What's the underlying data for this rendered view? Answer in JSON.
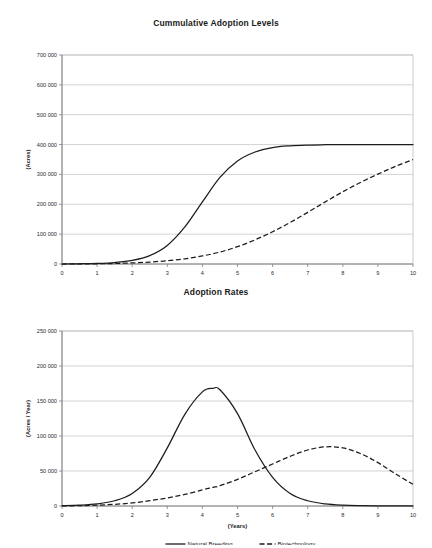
{
  "chart_data": [
    {
      "type": "line",
      "title": "Cummulative Adoption Levels",
      "xlabel": "(Years)",
      "ylabel": "(Acres)",
      "xlim": [
        0,
        10
      ],
      "ylim": [
        0,
        700000
      ],
      "xticks": [
        "0",
        "1",
        "2",
        "3",
        "4",
        "5",
        "6",
        "7",
        "8",
        "9",
        "10"
      ],
      "yticks": [
        "0",
        "100 000",
        "200 000",
        "300 000",
        "400 000",
        "500 000",
        "600 000",
        "700 000"
      ],
      "ytick_values": [
        0,
        100000,
        200000,
        300000,
        400000,
        500000,
        600000,
        700000
      ],
      "grid": true,
      "legend_position": "none",
      "x": [
        0,
        0.5,
        1,
        1.5,
        2,
        2.5,
        3,
        3.5,
        4,
        4.5,
        5,
        5.5,
        6,
        6.5,
        7,
        7.5,
        8,
        8.5,
        9,
        9.5,
        10
      ],
      "series": [
        {
          "name": "Natural Breeding",
          "style": "solid",
          "values": [
            0,
            800,
            2000,
            5000,
            12000,
            28000,
            62000,
            124000,
            208000,
            290000,
            345000,
            375000,
            390000,
            396000,
            398500,
            399500,
            400000,
            400000,
            400000,
            400000,
            400000
          ]
        },
        {
          "name": "Biotechnology",
          "style": "dashed",
          "values": [
            0,
            300,
            800,
            1800,
            3600,
            6500,
            11000,
            17500,
            27000,
            40000,
            58000,
            81000,
            108000,
            139000,
            173000,
            208000,
            242000,
            273000,
            301000,
            327000,
            350000
          ]
        }
      ]
    },
    {
      "type": "line",
      "title": "Adoption Rates",
      "xlabel": "(Years)",
      "ylabel": "(Acres / Year)",
      "xlim": [
        0,
        10
      ],
      "ylim": [
        0,
        250000
      ],
      "xticks": [
        "0",
        "1",
        "2",
        "3",
        "4",
        "5",
        "6",
        "7",
        "8",
        "9",
        "10"
      ],
      "yticks": [
        "0",
        "50 000",
        "100 000",
        "150 000",
        "200 000",
        "250 000"
      ],
      "ytick_values": [
        0,
        50000,
        100000,
        150000,
        200000,
        250000
      ],
      "grid": true,
      "legend_position": "bottom",
      "x": [
        0,
        0.5,
        1,
        1.5,
        2,
        2.5,
        3,
        3.5,
        4,
        4.3,
        4.5,
        5,
        5.5,
        6,
        6.5,
        7,
        7.5,
        8,
        8.5,
        9,
        9.5,
        10
      ],
      "series": [
        {
          "name": "Natural Breeding",
          "style": "solid",
          "values": [
            400,
            1200,
            3000,
            7500,
            18000,
            41000,
            83000,
            131000,
            163000,
            168000,
            166000,
            132000,
            80000,
            41000,
            18000,
            7500,
            3000,
            1200,
            500,
            200,
            100,
            50
          ]
        },
        {
          "name": "Biotechnology",
          "style": "dashed",
          "values": [
            200,
            500,
            1200,
            2400,
            4400,
            7600,
            11500,
            16500,
            23000,
            26500,
            29000,
            38000,
            49000,
            60000,
            71000,
            80000,
            84500,
            83000,
            75000,
            62000,
            46000,
            31000
          ]
        }
      ]
    }
  ],
  "legend": {
    "items": [
      {
        "label": "Natural Breeding",
        "style": "solid"
      },
      {
        "label": "Biotechnology",
        "style": "dashed"
      }
    ]
  }
}
